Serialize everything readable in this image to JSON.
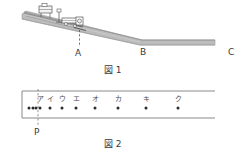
{
  "figure1": {
    "caption": "図 1",
    "points": [
      {
        "id": "A",
        "label": "A"
      },
      {
        "id": "B",
        "label": "B"
      },
      {
        "id": "C",
        "label": "C"
      }
    ],
    "description_icons": {
      "incline_track": "inclined-track",
      "cart": "cart-icon",
      "timer": "ticker-timer-icon",
      "dashed_marker": "dashed-drop-line"
    },
    "colors": {
      "track_fill": "#b9b9b9",
      "track_edge": "#8a8a8a",
      "outline": "#4a4a4a",
      "dashed": "#555555"
    }
  },
  "figure2": {
    "caption": "図 2",
    "tape_label": "P",
    "dot_labels": [
      "ア",
      "イ",
      "ウ",
      "エ",
      "オ",
      "カ",
      "キ",
      "ク"
    ],
    "colors": {
      "tape_border": "#7d7d7d",
      "dot": "#2b2b2b",
      "dashed": "#777777"
    },
    "chart_data": {
      "type": "scatter",
      "title": "図 2",
      "xlabel": "",
      "ylabel": "",
      "categories": [
        "ア",
        "イ",
        "ウ",
        "エ",
        "オ",
        "カ",
        "キ",
        "ク"
      ],
      "x": [
        40,
        50,
        62,
        76,
        95,
        118,
        146,
        178
      ],
      "values": [
        1,
        1,
        1,
        1,
        1,
        1,
        1,
        1
      ],
      "pre_p_dots_x": [
        29,
        33,
        36
      ],
      "p_marker_x": 38,
      "xlim": [
        22,
        215
      ],
      "grid": false,
      "legend": "none"
    }
  }
}
